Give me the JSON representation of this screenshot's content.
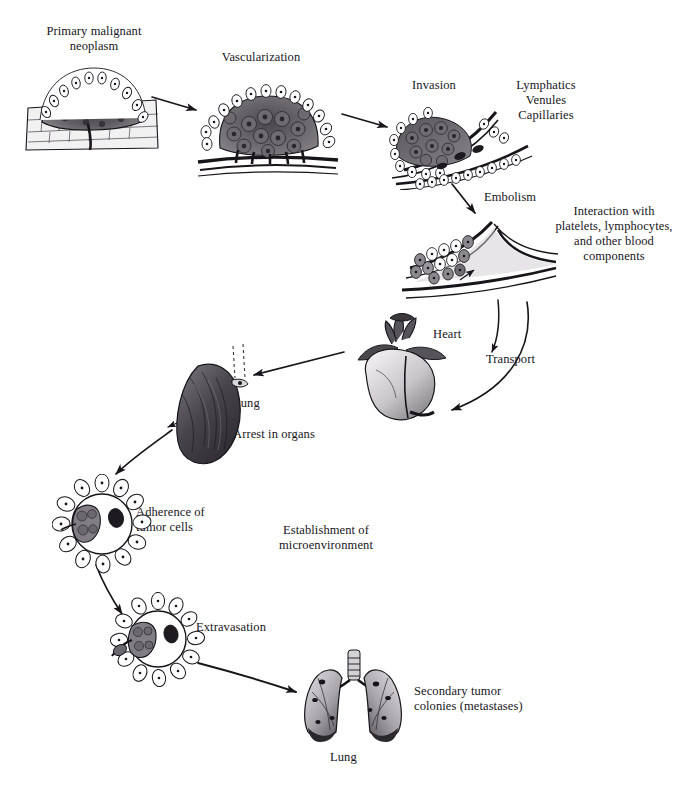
{
  "figure": {
    "type": "biological-process-diagram",
    "background": "#ffffff",
    "ink": "#17151a"
  },
  "labels": {
    "primary_neoplasm": "Primary malignant\nneoplasm",
    "vascularization": "Vascularization",
    "invasion": "Invasion",
    "vessels": "Lymphatics\nVenules\nCapillaries",
    "embolism": "Embolism",
    "interaction": "Interaction with\nplatelets, lymphocytes,\nand other blood\ncomponents",
    "heart": "Heart",
    "transport": "Transport",
    "lung_arrest": "Lung",
    "arrest_in_organs": "Arrest in organs",
    "adherence": "Adherence of\ntumor cells",
    "establishment": "Establishment of\nmicroenvironment",
    "extravasation": "Extravasation",
    "secondary_colonies": "Secondary tumor\ncolonies (metastases)",
    "lung_secondary": "Lung"
  },
  "stages": [
    {
      "id": "primary",
      "order": 1,
      "label": "Primary malignant neoplasm"
    },
    {
      "id": "vascularization",
      "order": 2,
      "label": "Vascularization"
    },
    {
      "id": "invasion",
      "order": 3,
      "label": "Invasion"
    },
    {
      "id": "embolism",
      "order": 4,
      "label": "Embolism"
    },
    {
      "id": "transport",
      "order": 5,
      "label": "Transport"
    },
    {
      "id": "arrest",
      "order": 6,
      "label": "Arrest in organs"
    },
    {
      "id": "adherence",
      "order": 7,
      "label": "Adherence of tumor cells"
    },
    {
      "id": "extravasation",
      "order": 8,
      "label": "Extravasation"
    },
    {
      "id": "metastases",
      "order": 9,
      "label": "Secondary tumor colonies (metastases)"
    }
  ],
  "illustrations": [
    {
      "id": "primary-tumor-art",
      "name": "Primary malignant neoplasm in epithelium"
    },
    {
      "id": "vascularized-tumor-art",
      "name": "Vascularized tumor mass on basement membrane"
    },
    {
      "id": "invasion-art",
      "name": "Tumor invading vessel wall"
    },
    {
      "id": "embolism-art",
      "name": "Tumor cell embolus in vessel"
    },
    {
      "id": "heart-art",
      "name": "Heart"
    },
    {
      "id": "lung-arrest-art",
      "name": "Lung with arrested tumor cells"
    },
    {
      "id": "adherence-art",
      "name": "Tumor cells adhering inside capillary"
    },
    {
      "id": "extravasation-art",
      "name": "Tumor cells extravasating from capillary"
    },
    {
      "id": "lungs-metastases-art",
      "name": "Lungs bearing metastatic colonies"
    }
  ]
}
